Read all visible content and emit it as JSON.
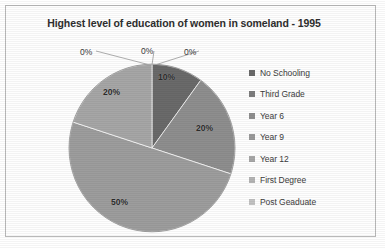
{
  "chart_data": {
    "type": "pie",
    "title": "Highest level of education of women in someland - 1995",
    "categories": [
      "No Schooling",
      "Third Grade",
      "Year 6",
      "Year 9",
      "Year 12",
      "First Degree",
      "Post Geaduate"
    ],
    "values": [
      10,
      20,
      50,
      20,
      0,
      0,
      0
    ],
    "value_labels": [
      "10%",
      "20%",
      "50%",
      "20%",
      "0%",
      "0%",
      "0%"
    ],
    "colors": [
      "#6a6a6a",
      "#8e8e8e",
      "#9d9d9d",
      "#a6a6a6",
      "#b4b4b4",
      "#bdbdbd",
      "#c6c6c6"
    ],
    "legend_position": "right",
    "start_angle_deg": 0,
    "direction": "clockwise",
    "grid": false,
    "xlabel": "",
    "ylabel": ""
  },
  "frame": {
    "border_color": "#b9b9b9",
    "background": "#fefefe"
  },
  "title": {
    "text": "Highest level of education of women in someland - 1995"
  },
  "pie": {
    "center_x": 152,
    "center_y": 148,
    "radius": 83,
    "slices": [
      {
        "name": "No Schooling",
        "label": "10%",
        "value": 10,
        "color": "#6a6a6a",
        "label_x": 158,
        "label_y": 72
      },
      {
        "name": "Third Grade",
        "label": "20%",
        "value": 20,
        "color": "#8e8e8e",
        "label_x": 196,
        "label_y": 123
      },
      {
        "name": "Year 6",
        "label": "50%",
        "value": 50,
        "color": "#9d9d9d",
        "label_x": 111,
        "label_y": 197
      },
      {
        "name": "Year 9",
        "label": "20%",
        "value": 20,
        "color": "#a6a6a6",
        "label_x": 103,
        "label_y": 87
      },
      {
        "name": "Year 12",
        "label": "0%",
        "value": 0,
        "color": "#b4b4b4",
        "label_x": 80,
        "label_y": 47
      },
      {
        "name": "First Degree",
        "label": "0%",
        "value": 0,
        "color": "#bdbdbd",
        "label_x": 141,
        "label_y": 46
      },
      {
        "name": "Post Geaduate",
        "label": "0%",
        "value": 0,
        "color": "#c6c6c6",
        "label_x": 184,
        "label_y": 47
      }
    ]
  },
  "legend": {
    "items": [
      {
        "label": "No Schooling",
        "color": "#6a6a6a"
      },
      {
        "label": "Third Grade",
        "color": "#7d7d7d"
      },
      {
        "label": "Year 6",
        "color": "#8e8e8e"
      },
      {
        "label": "Year 9",
        "color": "#9a9a9a"
      },
      {
        "label": "Year 12",
        "color": "#a6a6a6"
      },
      {
        "label": "First Degree",
        "color": "#b4b4b4"
      },
      {
        "label": "Post Geaduate",
        "color": "#c2c2c2"
      }
    ]
  }
}
